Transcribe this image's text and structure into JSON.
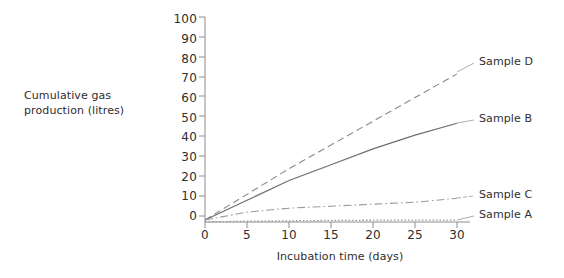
{
  "chart_data": {
    "type": "line",
    "title": "",
    "xlabel": "Incubation time (days)",
    "ylabel": "Cumulative gas production (litres)",
    "xlim": [
      0,
      30
    ],
    "ylim": [
      0,
      100
    ],
    "xticks": [
      0,
      5,
      10,
      15,
      20,
      25,
      30
    ],
    "yticks": [
      0,
      10,
      20,
      30,
      40,
      50,
      60,
      70,
      80,
      90,
      100
    ],
    "grid": false,
    "legend_position": "right-inline-labels",
    "x": [
      0,
      5,
      10,
      15,
      20,
      25,
      30
    ],
    "series": [
      {
        "name": "Sample D",
        "label": "Sample D",
        "style": "dashed",
        "color": "#8a8a8a",
        "values": [
          1,
          14,
          27,
          39,
          51,
          63,
          75
        ]
      },
      {
        "name": "Sample B",
        "label": "Sample B",
        "style": "solid",
        "color": "#6e6e6e",
        "values": [
          1,
          11,
          21,
          29,
          37,
          44,
          50
        ]
      },
      {
        "name": "Sample C",
        "label": "Sample C",
        "style": "dash-dot",
        "color": "#9a9a9a",
        "values": [
          1,
          5,
          7,
          8,
          9,
          10,
          12
        ]
      },
      {
        "name": "Sample A",
        "label": "Sample A",
        "style": "dotted",
        "color": "#9a9a9a",
        "values": [
          0,
          0.4,
          0.6,
          0.8,
          0.9,
          1,
          1
        ]
      }
    ]
  },
  "axes": {
    "y_title_line1": "Cumulative gas",
    "y_title_line2": "production (litres)",
    "x_title": "Incubation time (days)",
    "ytick_labels": [
      "100",
      "90",
      "80",
      "70",
      "60",
      "50",
      "40",
      "30",
      "20",
      "10",
      "0"
    ],
    "xtick_labels": [
      "0",
      "5",
      "10",
      "15",
      "20",
      "25",
      "30"
    ]
  },
  "labels": {
    "sample_d": "Sample D",
    "sample_b": "Sample B",
    "sample_c": "Sample C",
    "sample_a": "Sample A"
  },
  "colors": {
    "axis": "#8d8d8d",
    "text": "#2e2e2e",
    "series_d": "#8a8a8a",
    "series_b": "#6e6e6e",
    "series_c": "#9a9a9a",
    "series_a": "#9a9a9a"
  }
}
